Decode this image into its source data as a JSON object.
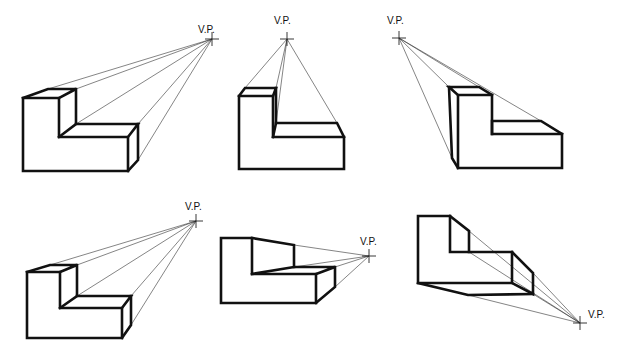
{
  "diagram": {
    "title": "",
    "vp_label": "V.P.",
    "figures": [
      {
        "id": 1,
        "vp": [
          212,
          39
        ],
        "label_pos": [
          198,
          33
        ],
        "solid": [
          "M23,98 L59,98 L59,137 L128,137 L128,171 L23,171 Z",
          "M23,98 L48,89 L76,89 L59,98",
          "M76,89 L76,124 L59,137",
          "M76,124 L138,124 L128,137",
          "M138,124 L138,160 L128,171"
        ],
        "projectors": [
          [
            48,
            89
          ],
          [
            76,
            89
          ],
          [
            76,
            124
          ],
          [
            138,
            124
          ],
          [
            138,
            160
          ]
        ]
      },
      {
        "id": 2,
        "vp": [
          287,
          39
        ],
        "label_pos": [
          274,
          24
        ],
        "solid": [
          "M239,96 L273,96 L273,137 L344,137 L344,169 L239,169 Z",
          "M239,96 L245,88 L276,88 L273,96",
          "M276,88 L276,123 L273,137",
          "M276,123 L337,123 L344,137"
        ],
        "projectors": [
          [
            245,
            88
          ],
          [
            276,
            88
          ],
          [
            276,
            123
          ],
          [
            337,
            123
          ]
        ]
      },
      {
        "id": 3,
        "vp": [
          399,
          38
        ],
        "label_pos": [
          387,
          24
        ],
        "solid": [
          "M458,95 L492,95 L492,134 L562,134 L562,168 L458,168 Z",
          "M458,95 L449,87 L479,87 L492,95",
          "M449,87 L452,158 L458,168",
          "M492,134 L492,121 L541,121 L562,134"
        ],
        "projectors": [
          [
            449,
            87
          ],
          [
            479,
            87
          ],
          [
            452,
            158
          ],
          [
            541,
            121
          ]
        ]
      },
      {
        "id": 4,
        "vp": [
          196,
          221
        ],
        "label_pos": [
          185,
          210
        ],
        "solid": [
          "M27,272 L60,272 L60,308 L122,308 L122,338 L27,338 Z",
          "M27,272 L50,265 L77,265 L60,272",
          "M77,265 L77,296 L60,308",
          "M77,296 L131,296 L122,308",
          "M131,296 L131,325 L122,338"
        ],
        "projectors": [
          [
            50,
            265
          ],
          [
            77,
            265
          ],
          [
            77,
            296
          ],
          [
            131,
            296
          ],
          [
            131,
            325
          ]
        ]
      },
      {
        "id": 5,
        "vp": [
          369,
          256
        ],
        "label_pos": [
          360,
          245
        ],
        "solid": [
          "M221,238 L252,238 L252,274 L316,274 L316,303 L221,303 Z",
          "M252,238 L294,245 L294,267",
          "M252,274 L294,267 L335,267 L316,274",
          "M335,267 L335,287 L316,303"
        ],
        "projectors": [
          [
            294,
            245
          ],
          [
            294,
            267
          ],
          [
            335,
            267
          ],
          [
            335,
            287
          ]
        ]
      },
      {
        "id": 6,
        "vp": [
          580,
          323
        ],
        "label_pos": [
          588,
          318
        ],
        "solid": [
          "M418,216 L450,216 L450,252 L512,252 L512,283 L418,283 Z",
          "M450,216 L469,231 L469,252",
          "M512,252 L533,273 L533,294 L512,283",
          "M418,283 L468,295 L533,294"
        ],
        "projectors": [
          [
            469,
            231
          ],
          [
            469,
            252
          ],
          [
            533,
            273
          ],
          [
            533,
            294
          ],
          [
            468,
            295
          ]
        ]
      }
    ]
  }
}
